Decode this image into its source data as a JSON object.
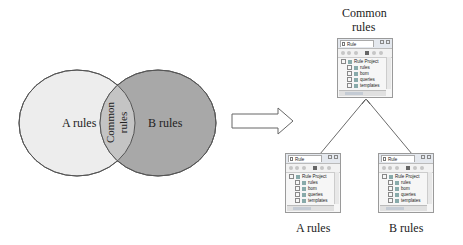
{
  "venn": {
    "left_label": "A rules",
    "right_label": "B rules",
    "overlap_label_line1": "Common",
    "overlap_label_line2": "rules",
    "colors": {
      "left_fill": "#ededed",
      "right_fill": "#a8a8a8",
      "overlap_fill": "#c4c4c4",
      "stroke": "#555555"
    }
  },
  "transform_arrow": {
    "icon": "hollow-right-arrow"
  },
  "hierarchy": {
    "top": {
      "caption_line1": "Common",
      "caption_line2": "rules",
      "panel": {
        "tab_title": "Rule Explorer",
        "tree": [
          {
            "label": "Rule Project",
            "level": 0
          },
          {
            "label": "rules",
            "level": 1
          },
          {
            "label": "bom",
            "level": 1
          },
          {
            "label": "queries",
            "level": 1
          },
          {
            "label": "templates",
            "level": 1
          }
        ]
      }
    },
    "bottom_left": {
      "caption": "A rules",
      "panel": {
        "tab_title": "Rule Explorer",
        "tree": [
          {
            "label": "Rule Project",
            "level": 0
          },
          {
            "label": "rules",
            "level": 1
          },
          {
            "label": "bom",
            "level": 1
          },
          {
            "label": "queries",
            "level": 1
          },
          {
            "label": "templates",
            "level": 1
          }
        ]
      }
    },
    "bottom_right": {
      "caption": "B rules",
      "panel": {
        "tab_title": "Rule Explorer",
        "tree": [
          {
            "label": "Rule Project",
            "level": 0
          },
          {
            "label": "rules",
            "level": 1
          },
          {
            "label": "bom",
            "level": 1
          },
          {
            "label": "queries",
            "level": 1
          },
          {
            "label": "templates",
            "level": 1
          }
        ]
      }
    }
  }
}
